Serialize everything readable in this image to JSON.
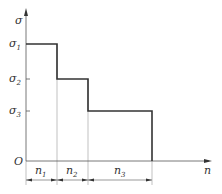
{
  "diagram": {
    "type": "step-load-spectrum",
    "y_axis": {
      "label": "σ"
    },
    "x_axis": {
      "label": "n"
    },
    "origin": {
      "label": "O"
    },
    "levels": [
      {
        "symbol": "σ",
        "subscript": "1"
      },
      {
        "symbol": "σ",
        "subscript": "2"
      },
      {
        "symbol": "σ",
        "subscript": "3"
      }
    ],
    "durations": [
      {
        "symbol": "n",
        "subscript": "1"
      },
      {
        "symbol": "n",
        "subscript": "2"
      },
      {
        "symbol": "n",
        "subscript": "3"
      }
    ],
    "colors": {
      "line": "#333333",
      "thin": "#888888",
      "text": "#333333"
    }
  }
}
